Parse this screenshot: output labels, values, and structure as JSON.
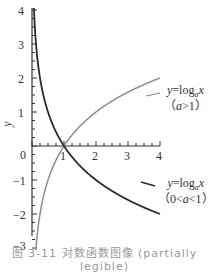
{
  "chart_data": {
    "type": "line",
    "title": "",
    "xlabel": "",
    "ylabel": "y",
    "xlim": [
      0,
      4
    ],
    "ylim": [
      -3,
      4
    ],
    "x_ticks": [
      "0",
      "1",
      "2",
      "3",
      "4"
    ],
    "y_ticks": [
      "4",
      "3",
      "2",
      "1",
      "-1",
      "-2",
      "-3"
    ],
    "grid": false,
    "legend_position": "inline labels at right",
    "series": [
      {
        "name": "y=log_a x (a>1)",
        "color": "#8c8c8c",
        "function": "log2(x)",
        "x": [
          0.125,
          0.25,
          0.5,
          1,
          2,
          3,
          4
        ],
        "values": [
          -3,
          -2,
          -1,
          0,
          1,
          1.585,
          2
        ]
      },
      {
        "name": "y=log_a x (0<a<1)",
        "color": "#2b2b2b",
        "function": "log_{1/2}(x)",
        "x": [
          0.0625,
          0.125,
          0.25,
          0.5,
          1,
          2,
          3,
          4
        ],
        "values": [
          4,
          3,
          2,
          1,
          0,
          -1,
          -1.585,
          -2
        ]
      }
    ],
    "annotations": [
      {
        "text": "y=log_a x",
        "sub": "(a>1)",
        "anchor": "upper curve, right end"
      },
      {
        "text": "y=log_a x",
        "sub": "(0<a<1)",
        "anchor": "lower curve, right end"
      }
    ]
  },
  "axes": {
    "y_label": "y",
    "origin": "0",
    "x_ticks": [
      "1",
      "2",
      "3",
      "4"
    ],
    "y_ticks_pos": [
      "4",
      "3",
      "2",
      "1"
    ],
    "y_ticks_neg": [
      "−1",
      "−2",
      "−3"
    ]
  },
  "labels": {
    "upper": {
      "y": "y",
      "eq": "=log",
      "sub": "a",
      "x": "x",
      "cond_open": "（",
      "cond_a": "a",
      "cond_rel": ">1",
      "cond_close": "）"
    },
    "lower": {
      "y": "y",
      "eq": "=log",
      "sub": "a",
      "x": "x",
      "cond_open": "（0<",
      "cond_a": "a",
      "cond_rel": "<1",
      "cond_close": "）"
    }
  },
  "caption": "图 3-11 对数函数图像 (partially legible)"
}
